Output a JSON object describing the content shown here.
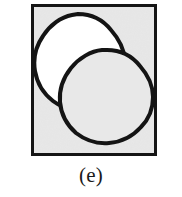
{
  "figure": {
    "caption": "(e)",
    "panel_label": "e",
    "frame": {
      "x": 31,
      "y": 4,
      "width": 126,
      "height": 152,
      "border_color": "#151515",
      "border_width": 3,
      "fill_color": "#e8e8e8"
    },
    "shapes": [
      {
        "name": "left-circle",
        "role": "filled-region",
        "cx": 47,
        "cy": 57,
        "r": 48,
        "fill_color": "#ffffff",
        "stroke_color": "#141414",
        "stroke_width": 4,
        "style": "hand-drawn"
      },
      {
        "name": "right-circle",
        "role": "outline-region",
        "cx": 76,
        "cy": 93,
        "r": 47,
        "fill_color": "#e8e8e8",
        "stroke_color": "#141414",
        "stroke_width": 4,
        "style": "hand-drawn"
      }
    ],
    "relation": "two overlapping circles",
    "background_color": "#ffffff"
  }
}
